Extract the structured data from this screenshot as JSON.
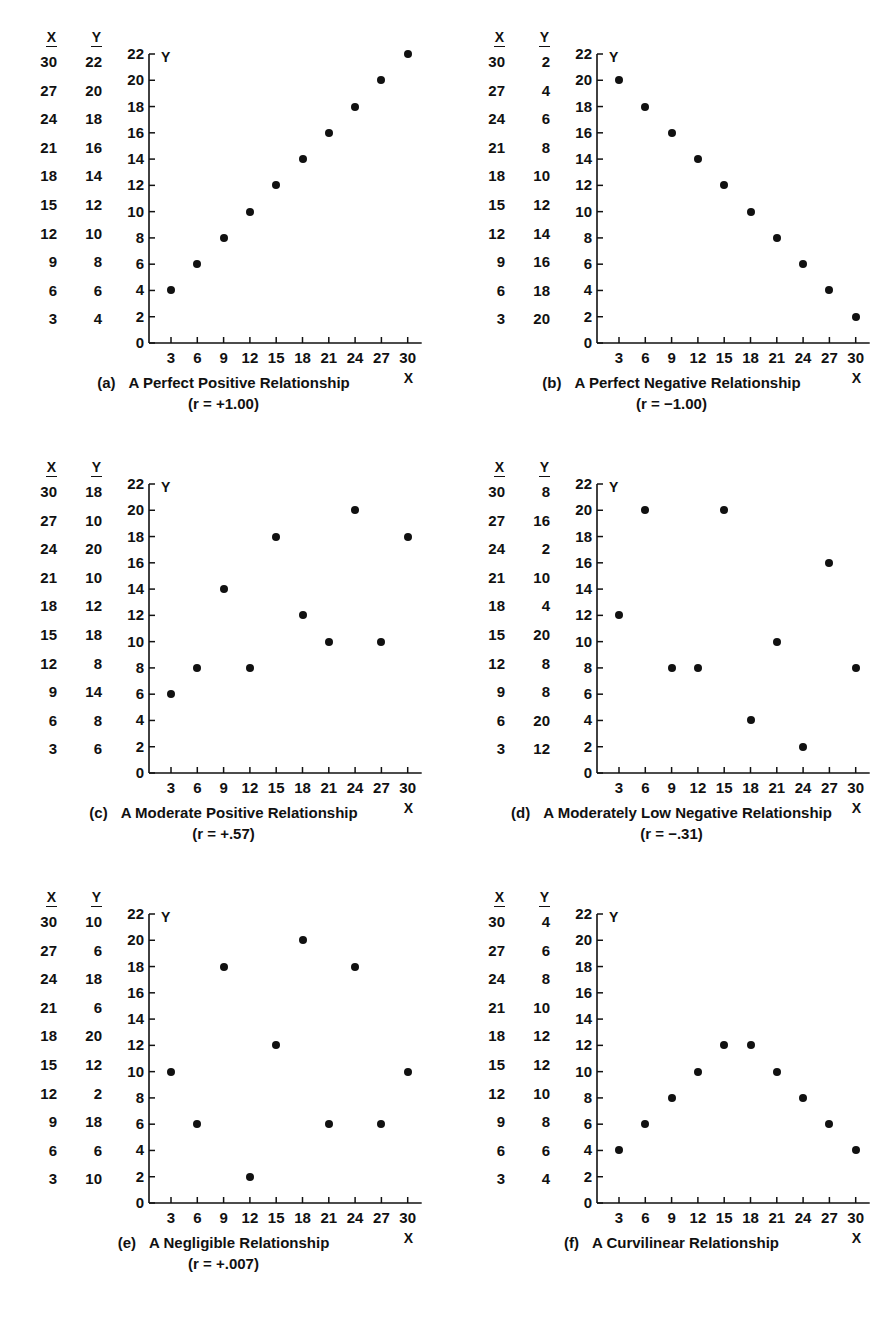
{
  "figure": {
    "columns": [
      "X",
      "Y"
    ],
    "axis_labels": {
      "x": "X",
      "y": "Y"
    },
    "y_ticks": [
      0,
      2,
      4,
      6,
      8,
      10,
      12,
      14,
      16,
      18,
      20,
      22
    ],
    "x_ticks": [
      3,
      6,
      9,
      12,
      15,
      18,
      21,
      24,
      27,
      30
    ]
  },
  "chart_data": [
    {
      "type": "scatter",
      "panel": "a",
      "letter": "(a)",
      "title": "A Perfect Positive Relationship",
      "annotation": "(r = +1.00)",
      "r": "+1.00",
      "xlabel": "X",
      "ylabel": "Y",
      "xlim": [
        0,
        31
      ],
      "ylim": [
        0,
        22
      ],
      "grid": false,
      "x": [
        30,
        27,
        24,
        21,
        18,
        15,
        12,
        9,
        6,
        3
      ],
      "y": [
        22,
        20,
        18,
        16,
        14,
        12,
        10,
        8,
        6,
        4
      ]
    },
    {
      "type": "scatter",
      "panel": "b",
      "letter": "(b)",
      "title": "A Perfect Negative Relationship",
      "annotation": "(r = −1.00)",
      "r": "−1.00",
      "xlabel": "X",
      "ylabel": "Y",
      "xlim": [
        0,
        31
      ],
      "ylim": [
        0,
        22
      ],
      "grid": false,
      "x": [
        30,
        27,
        24,
        21,
        18,
        15,
        12,
        9,
        6,
        3
      ],
      "y": [
        2,
        4,
        6,
        8,
        10,
        12,
        14,
        16,
        18,
        20
      ]
    },
    {
      "type": "scatter",
      "panel": "c",
      "letter": "(c)",
      "title": "A Moderate Positive Relationship",
      "annotation": "(r = +.57)",
      "r": "+.57",
      "xlabel": "X",
      "ylabel": "Y",
      "xlim": [
        0,
        31
      ],
      "ylim": [
        0,
        22
      ],
      "grid": false,
      "x": [
        30,
        27,
        24,
        21,
        18,
        15,
        12,
        9,
        6,
        3
      ],
      "y": [
        18,
        10,
        20,
        10,
        12,
        18,
        8,
        14,
        8,
        6
      ]
    },
    {
      "type": "scatter",
      "panel": "d",
      "letter": "(d)",
      "title": "A Moderately Low Negative Relationship",
      "annotation": "(r = −.31)",
      "r": "−.31",
      "xlabel": "X",
      "ylabel": "Y",
      "xlim": [
        0,
        31
      ],
      "ylim": [
        0,
        22
      ],
      "grid": false,
      "x": [
        30,
        27,
        24,
        21,
        18,
        15,
        12,
        9,
        6,
        3
      ],
      "y": [
        8,
        16,
        2,
        10,
        4,
        20,
        8,
        8,
        20,
        12
      ]
    },
    {
      "type": "scatter",
      "panel": "e",
      "letter": "(e)",
      "title": "A Negligible Relationship",
      "annotation": "(r = +.007)",
      "r": "+.007",
      "xlabel": "X",
      "ylabel": "Y",
      "xlim": [
        0,
        31
      ],
      "ylim": [
        0,
        22
      ],
      "grid": false,
      "x": [
        30,
        27,
        24,
        21,
        18,
        15,
        12,
        9,
        6,
        3
      ],
      "y": [
        10,
        6,
        18,
        6,
        20,
        12,
        2,
        18,
        6,
        10
      ]
    },
    {
      "type": "scatter",
      "panel": "f",
      "letter": "(f)",
      "title": "A Curvilinear Relationship",
      "annotation": "",
      "r": "",
      "xlabel": "X",
      "ylabel": "Y",
      "xlim": [
        0,
        31
      ],
      "ylim": [
        0,
        22
      ],
      "grid": false,
      "x": [
        30,
        27,
        24,
        21,
        18,
        15,
        12,
        9,
        6,
        3
      ],
      "y": [
        4,
        6,
        8,
        10,
        12,
        12,
        10,
        8,
        6,
        4
      ]
    }
  ]
}
